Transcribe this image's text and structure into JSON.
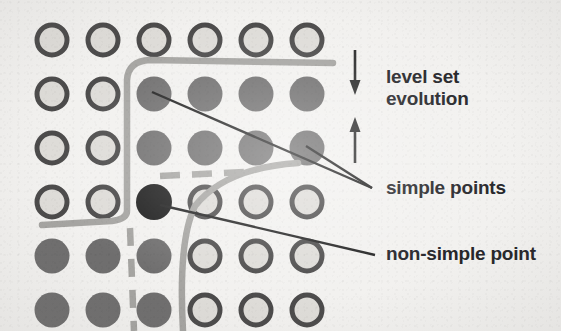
{
  "figure": {
    "background_color": "#f2f1ef"
  },
  "colors": {
    "open_circle_stroke": "#4c4b4b",
    "open_circle_fill": "#dedcd8",
    "filled_circle": "#6f6e6e",
    "nonsimple_circle": "#1d1d1d",
    "curve_gray": "#a5a4a1",
    "leader_line": "#222222",
    "arrow": "#2a2a2a",
    "text": "#26262a"
  },
  "grid": {
    "columns": 6,
    "rows": 6,
    "origin_x": 52,
    "origin_y": 40,
    "step_x": 51,
    "step_y": 54,
    "radius": 16,
    "stroke_width": 5,
    "cells": [
      [
        "open",
        "open",
        "open",
        "open",
        "open",
        "open"
      ],
      [
        "open",
        "open",
        "filled",
        "filled",
        "filled",
        "filled"
      ],
      [
        "open",
        "open",
        "filled",
        "filled",
        "filled",
        "filled"
      ],
      [
        "open",
        "open",
        "nonsimple",
        "open",
        "open",
        "open"
      ],
      [
        "filled",
        "filled",
        "filled",
        "open",
        "open",
        "open"
      ],
      [
        "filled",
        "filled",
        "filled",
        "open",
        "open",
        "open"
      ]
    ]
  },
  "labels": {
    "level_set": "level set\nevolution",
    "simple_points": "simple points",
    "non_simple_point": "non-simple point"
  },
  "arrows": {
    "down_arrow": "arrow-down",
    "up_arrow": "arrow-up"
  },
  "annotations": {
    "simple_point_targets": 2,
    "non_simple_point_targets": 1
  }
}
